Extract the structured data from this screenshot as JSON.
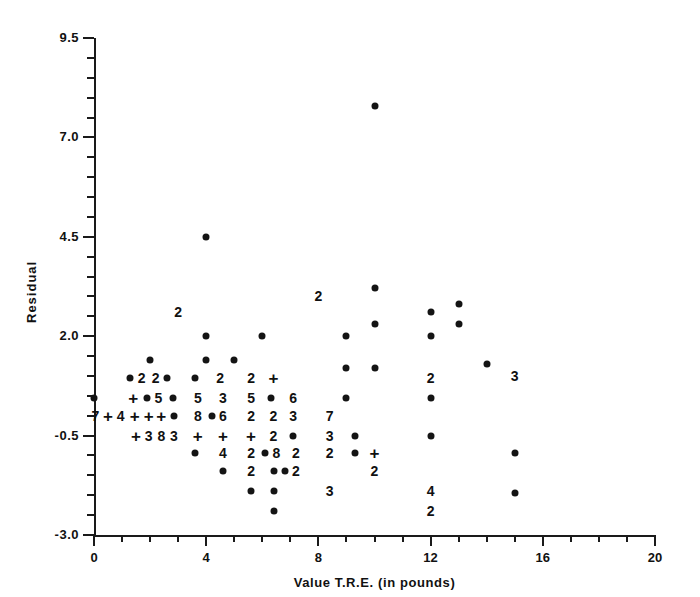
{
  "chart_data": {
    "type": "scatter",
    "title": "",
    "xlabel": "Value T.R.E. (in pounds)",
    "ylabel": "Residual",
    "xlim": [
      0,
      20
    ],
    "ylim": [
      -3.0,
      9.5
    ],
    "xticks": [
      0,
      4,
      8,
      12,
      16,
      20
    ],
    "xtick_labels": [
      "0",
      "4",
      "8",
      "12",
      "16",
      "20"
    ],
    "yticks": [
      -3.0,
      -0.5,
      2.0,
      4.5,
      7.0,
      9.5
    ],
    "ytick_labels": [
      "-3.0",
      "-0.5",
      "2.0",
      "4.5",
      "7.0",
      "9.5"
    ],
    "x_minor_interval": 1,
    "y_minor_interval": 0.5,
    "grid": false,
    "legend": null,
    "marker_note": "Single observations are drawn as filled dots; overlapping observations are drawn as a digit giving the count; '+' marks a count of 10 or more",
    "points": [
      {
        "x": 10.0,
        "y": 7.8,
        "marker": "dot",
        "label": ""
      },
      {
        "x": 4.0,
        "y": 4.5,
        "marker": "dot",
        "label": ""
      },
      {
        "x": 10.0,
        "y": 3.2,
        "marker": "dot",
        "label": ""
      },
      {
        "x": 8.0,
        "y": 3.0,
        "marker": "digit",
        "label": "2"
      },
      {
        "x": 12.0,
        "y": 2.6,
        "marker": "dot",
        "label": ""
      },
      {
        "x": 13.0,
        "y": 2.8,
        "marker": "dot",
        "label": ""
      },
      {
        "x": 3.0,
        "y": 2.6,
        "marker": "digit",
        "label": "2"
      },
      {
        "x": 10.0,
        "y": 2.3,
        "marker": "dot",
        "label": ""
      },
      {
        "x": 13.0,
        "y": 2.3,
        "marker": "dot",
        "label": ""
      },
      {
        "x": 4.0,
        "y": 2.0,
        "marker": "dot",
        "label": ""
      },
      {
        "x": 6.0,
        "y": 2.0,
        "marker": "dot",
        "label": ""
      },
      {
        "x": 9.0,
        "y": 2.0,
        "marker": "dot",
        "label": ""
      },
      {
        "x": 12.0,
        "y": 2.0,
        "marker": "dot",
        "label": ""
      },
      {
        "x": 2.0,
        "y": 1.4,
        "marker": "dot",
        "label": ""
      },
      {
        "x": 4.0,
        "y": 1.4,
        "marker": "dot",
        "label": ""
      },
      {
        "x": 5.0,
        "y": 1.4,
        "marker": "dot",
        "label": ""
      },
      {
        "x": 9.0,
        "y": 1.2,
        "marker": "dot",
        "label": ""
      },
      {
        "x": 10.0,
        "y": 1.2,
        "marker": "dot",
        "label": ""
      },
      {
        "x": 14.0,
        "y": 1.3,
        "marker": "dot",
        "label": ""
      },
      {
        "x": 1.3,
        "y": 0.95,
        "marker": "dot",
        "label": ""
      },
      {
        "x": 1.7,
        "y": 0.95,
        "marker": "digit",
        "label": "2"
      },
      {
        "x": 2.2,
        "y": 0.95,
        "marker": "digit",
        "label": "2"
      },
      {
        "x": 2.6,
        "y": 0.95,
        "marker": "dot",
        "label": ""
      },
      {
        "x": 3.6,
        "y": 0.95,
        "marker": "dot",
        "label": ""
      },
      {
        "x": 4.5,
        "y": 0.95,
        "marker": "digit",
        "label": "2"
      },
      {
        "x": 5.6,
        "y": 0.95,
        "marker": "digit",
        "label": "2"
      },
      {
        "x": 6.4,
        "y": 0.95,
        "marker": "plus",
        "label": "+"
      },
      {
        "x": 12.0,
        "y": 0.95,
        "marker": "digit",
        "label": "2"
      },
      {
        "x": 15.0,
        "y": 1.0,
        "marker": "digit",
        "label": "3"
      },
      {
        "x": 0.0,
        "y": 0.45,
        "marker": "dot",
        "label": ""
      },
      {
        "x": 1.4,
        "y": 0.45,
        "marker": "plus",
        "label": "+"
      },
      {
        "x": 1.9,
        "y": 0.45,
        "marker": "dot",
        "label": ""
      },
      {
        "x": 2.3,
        "y": 0.45,
        "marker": "digit",
        "label": "5"
      },
      {
        "x": 2.8,
        "y": 0.45,
        "marker": "dot",
        "label": ""
      },
      {
        "x": 3.7,
        "y": 0.45,
        "marker": "digit",
        "label": "5"
      },
      {
        "x": 4.6,
        "y": 0.45,
        "marker": "digit",
        "label": "3"
      },
      {
        "x": 5.6,
        "y": 0.45,
        "marker": "digit",
        "label": "5"
      },
      {
        "x": 6.3,
        "y": 0.45,
        "marker": "dot",
        "label": ""
      },
      {
        "x": 7.1,
        "y": 0.45,
        "marker": "digit",
        "label": "6"
      },
      {
        "x": 9.0,
        "y": 0.45,
        "marker": "dot",
        "label": ""
      },
      {
        "x": 12.0,
        "y": 0.45,
        "marker": "dot",
        "label": ""
      },
      {
        "x": 0.05,
        "y": 0.0,
        "marker": "digit",
        "label": "7"
      },
      {
        "x": 0.5,
        "y": 0.0,
        "marker": "plus",
        "label": "+"
      },
      {
        "x": 0.95,
        "y": 0.0,
        "marker": "digit",
        "label": "4"
      },
      {
        "x": 1.45,
        "y": 0.0,
        "marker": "plus",
        "label": "+"
      },
      {
        "x": 1.95,
        "y": 0.0,
        "marker": "plus",
        "label": "+"
      },
      {
        "x": 2.4,
        "y": 0.0,
        "marker": "plus",
        "label": "+"
      },
      {
        "x": 2.85,
        "y": 0.0,
        "marker": "dot",
        "label": ""
      },
      {
        "x": 3.7,
        "y": 0.0,
        "marker": "digit",
        "label": "8"
      },
      {
        "x": 4.2,
        "y": 0.0,
        "marker": "dot",
        "label": ""
      },
      {
        "x": 4.6,
        "y": 0.0,
        "marker": "digit",
        "label": "6"
      },
      {
        "x": 5.6,
        "y": 0.0,
        "marker": "digit",
        "label": "2"
      },
      {
        "x": 6.4,
        "y": 0.0,
        "marker": "digit",
        "label": "2"
      },
      {
        "x": 7.1,
        "y": 0.0,
        "marker": "digit",
        "label": "3"
      },
      {
        "x": 8.4,
        "y": 0.0,
        "marker": "digit",
        "label": "7"
      },
      {
        "x": 1.5,
        "y": -0.5,
        "marker": "plus",
        "label": "+"
      },
      {
        "x": 1.95,
        "y": -0.5,
        "marker": "digit",
        "label": "3"
      },
      {
        "x": 2.4,
        "y": -0.5,
        "marker": "digit",
        "label": "8"
      },
      {
        "x": 2.85,
        "y": -0.5,
        "marker": "digit",
        "label": "3"
      },
      {
        "x": 3.7,
        "y": -0.5,
        "marker": "plus",
        "label": "+"
      },
      {
        "x": 4.6,
        "y": -0.5,
        "marker": "plus",
        "label": "+"
      },
      {
        "x": 5.6,
        "y": -0.5,
        "marker": "plus",
        "label": "+"
      },
      {
        "x": 6.4,
        "y": -0.5,
        "marker": "digit",
        "label": "2"
      },
      {
        "x": 7.1,
        "y": -0.5,
        "marker": "dot",
        "label": ""
      },
      {
        "x": 8.4,
        "y": -0.5,
        "marker": "digit",
        "label": "3"
      },
      {
        "x": 9.3,
        "y": -0.5,
        "marker": "dot",
        "label": ""
      },
      {
        "x": 12.0,
        "y": -0.5,
        "marker": "dot",
        "label": ""
      },
      {
        "x": 3.6,
        "y": -0.95,
        "marker": "dot",
        "label": ""
      },
      {
        "x": 4.6,
        "y": -0.95,
        "marker": "digit",
        "label": "4"
      },
      {
        "x": 5.6,
        "y": -0.95,
        "marker": "digit",
        "label": "2"
      },
      {
        "x": 6.1,
        "y": -0.95,
        "marker": "dot",
        "label": ""
      },
      {
        "x": 6.5,
        "y": -0.95,
        "marker": "digit",
        "label": "8"
      },
      {
        "x": 7.2,
        "y": -0.95,
        "marker": "digit",
        "label": "2"
      },
      {
        "x": 8.4,
        "y": -0.95,
        "marker": "digit",
        "label": "2"
      },
      {
        "x": 9.3,
        "y": -0.95,
        "marker": "dot",
        "label": ""
      },
      {
        "x": 10.0,
        "y": -0.95,
        "marker": "plus",
        "label": "+"
      },
      {
        "x": 15.0,
        "y": -0.95,
        "marker": "dot",
        "label": ""
      },
      {
        "x": 4.6,
        "y": -1.4,
        "marker": "dot",
        "label": ""
      },
      {
        "x": 5.6,
        "y": -1.4,
        "marker": "digit",
        "label": "2"
      },
      {
        "x": 6.4,
        "y": -1.4,
        "marker": "dot",
        "label": ""
      },
      {
        "x": 6.8,
        "y": -1.4,
        "marker": "dot",
        "label": ""
      },
      {
        "x": 7.2,
        "y": -1.4,
        "marker": "digit",
        "label": "2"
      },
      {
        "x": 10.0,
        "y": -1.4,
        "marker": "digit",
        "label": "2"
      },
      {
        "x": 5.6,
        "y": -1.9,
        "marker": "dot",
        "label": ""
      },
      {
        "x": 6.4,
        "y": -1.9,
        "marker": "dot",
        "label": ""
      },
      {
        "x": 8.4,
        "y": -1.9,
        "marker": "digit",
        "label": "3"
      },
      {
        "x": 12.0,
        "y": -1.9,
        "marker": "digit",
        "label": "4"
      },
      {
        "x": 15.0,
        "y": -1.95,
        "marker": "dot",
        "label": ""
      },
      {
        "x": 6.4,
        "y": -2.4,
        "marker": "dot",
        "label": ""
      },
      {
        "x": 12.0,
        "y": -2.4,
        "marker": "digit",
        "label": "2"
      }
    ]
  }
}
